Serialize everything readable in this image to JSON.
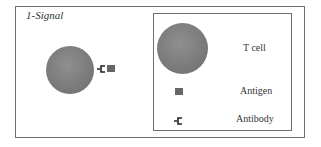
{
  "panel": {
    "title": "1-Signal"
  },
  "legend": {
    "items": [
      {
        "icon": "t-cell-icon",
        "label": "T cell"
      },
      {
        "icon": "antigen-icon",
        "label": "Antigen"
      },
      {
        "icon": "antibody-icon",
        "label": "Antibody"
      }
    ]
  },
  "colors": {
    "cell": "#7d7d7d",
    "antigen": "#666666",
    "border": "#6e6e6e"
  }
}
